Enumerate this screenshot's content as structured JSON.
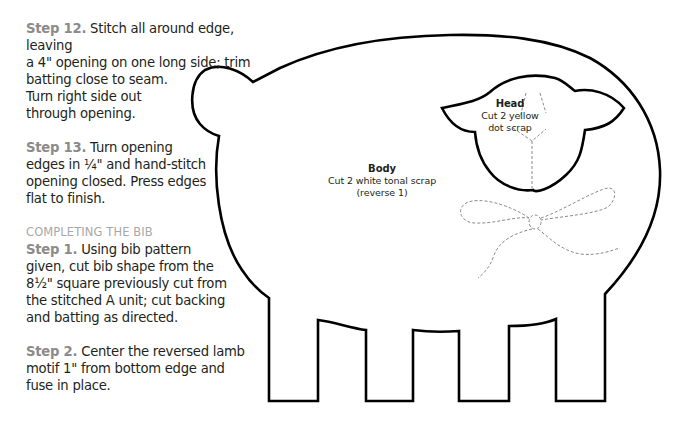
{
  "page": {
    "cutoff_line": "...ing.",
    "instructions": [
      {
        "step_label": "Step 12.",
        "lines": [
          "Stitch all around edge, leaving",
          "a 4\" opening on one long side; trim",
          "batting close to seam.",
          "Turn right side out",
          "through opening."
        ]
      },
      {
        "step_label": "Step 13.",
        "lines": [
          "Turn opening",
          "edges in ¼\" and hand-stitch",
          "opening closed. Press edges",
          "flat to finish."
        ]
      }
    ],
    "section_heading": "COMPLETING THE BIB",
    "bib_steps": [
      {
        "step_label": "Step 1.",
        "lines": [
          "Using bib pattern",
          "given, cut bib shape from the",
          "8½\" square previously cut from",
          "the stitched A unit; cut backing",
          "and batting as directed."
        ]
      },
      {
        "step_label": "Step 2.",
        "lines": [
          "Center the reversed lamb",
          "motif 1\" from bottom edge and",
          "fuse in place."
        ]
      }
    ]
  },
  "pattern": {
    "name": "lamb-pattern",
    "body": {
      "title": "Body",
      "line1": "Cut 2 white tonal scrap",
      "line2": "(reverse 1)"
    },
    "head": {
      "title": "Head",
      "line1": "Cut 2 yellow",
      "line2": "dot scrap"
    },
    "colors": {
      "outline": "#000000",
      "stitch": "#8a8a8a"
    }
  }
}
